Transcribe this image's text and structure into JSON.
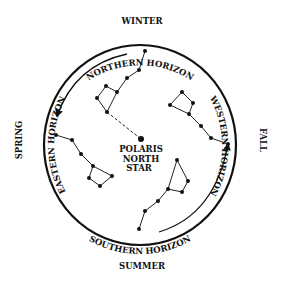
{
  "diagram": {
    "type": "seasonal-constellation-rotation",
    "colors": {
      "ink": "#111111",
      "background": "#ffffff"
    },
    "center": {
      "star_name_line1": "POLARIS",
      "star_name_line2": "NORTH",
      "star_name_line3": "STAR"
    },
    "labels": {
      "top_season": "WINTER",
      "top_horizon": "NORTHERN HORIZON",
      "right_season": "FALL",
      "right_horizon": "WESTERN HORIZON",
      "bottom_horizon": "SOUTHERN HORIZON",
      "bottom_season": "SUMMER",
      "left_season": "SPRING",
      "left_horizon": "EASTERN HORIZON"
    },
    "constellations": [
      {
        "name": "big-dipper-winter",
        "position": "upper-left"
      },
      {
        "name": "big-dipper-fall",
        "position": "right"
      },
      {
        "name": "big-dipper-spring",
        "position": "left"
      },
      {
        "name": "big-dipper-summer",
        "position": "lower-right"
      }
    ],
    "arrows": [
      {
        "name": "rotation-arrow-top-left",
        "direction": "counterclockwise"
      },
      {
        "name": "rotation-arrow-bottom-right",
        "direction": "counterclockwise"
      }
    ]
  }
}
